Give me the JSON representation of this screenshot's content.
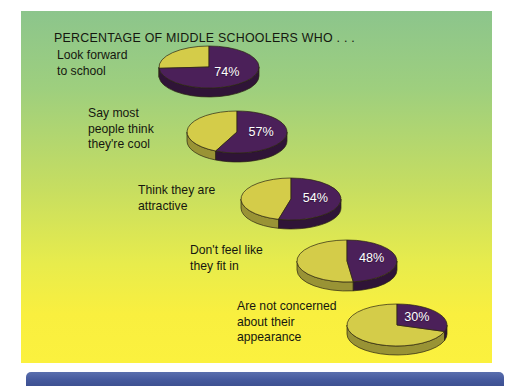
{
  "chart_data": {
    "type": "pie",
    "title": "PERCENTAGE OF MIDDLE SCHOOLERS WHO . . .",
    "xlabel": "",
    "ylabel": "",
    "grid": false,
    "legend_position": "none",
    "series_colors": {
      "yes_slice": "#4b2059",
      "no_slice": "#d4cc49",
      "panel_gradient_top": "#8cc58c",
      "panel_gradient_bottom": "#fbf13e",
      "bottom_bar": "#44589c",
      "label_text": "#15170f",
      "value_text": "#ffffff"
    },
    "categories": [
      "Look forward to school",
      "Say most people think they're cool",
      "Think they are attractive",
      "Don't feel like they fit in",
      "Are not concerned about their appearance"
    ],
    "values": [
      74,
      57,
      54,
      48,
      30
    ],
    "value_labels": [
      "74%",
      "57%",
      "54%",
      "48%",
      "30%"
    ],
    "note": "Each pie shows the percent of middle schoolers agreeing (purple) vs remainder (olive-yellow)."
  },
  "panel": {
    "title": "PERCENTAGE OF MIDDLE SCHOOLERS WHO . . ."
  },
  "rows": [
    {
      "id": "look-forward-to-school",
      "label_lines": [
        "Look forward",
        "to school"
      ],
      "value": 74,
      "value_label": "74%"
    },
    {
      "id": "people-think-theyre-cool",
      "label_lines": [
        "Say most",
        "people think",
        "they're cool"
      ],
      "value": 57,
      "value_label": "57%"
    },
    {
      "id": "think-they-are-attractive",
      "label_lines": [
        "Think they are",
        "attractive"
      ],
      "value": 54,
      "value_label": "54%"
    },
    {
      "id": "dont-feel-like-they-fit-in",
      "label_lines": [
        "Don't feel like",
        "they fit in"
      ],
      "value": 48,
      "value_label": "48%"
    },
    {
      "id": "not-concerned-about-appearance",
      "label_lines": [
        "Are not concerned",
        "about their",
        "appearance"
      ],
      "value": 30,
      "value_label": "30%"
    }
  ]
}
